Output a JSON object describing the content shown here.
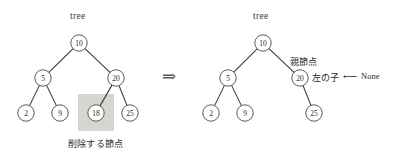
{
  "figure": {
    "title_left": "tree",
    "title_right": "tree",
    "transform_symbol": "⇒",
    "background_color": "#ffffff",
    "node_stroke_color": "#4a4a4a",
    "edge_color": "#3b3b3b",
    "highlight_color": "#d3d3ca"
  },
  "left_tree": {
    "label": "tree",
    "caption": "削除する節点",
    "nodes": [
      {
        "id": "l10",
        "value": "10",
        "cx": 79,
        "cy": 43
      },
      {
        "id": "l5",
        "value": "5",
        "cx": 43,
        "cy": 78
      },
      {
        "id": "l20",
        "value": "20",
        "cx": 116,
        "cy": 78
      },
      {
        "id": "l2",
        "value": "2",
        "cx": 26,
        "cy": 113
      },
      {
        "id": "l9",
        "value": "9",
        "cx": 60,
        "cy": 113
      },
      {
        "id": "l18",
        "value": "18",
        "cx": 96,
        "cy": 113
      },
      {
        "id": "l25",
        "value": "25",
        "cx": 130,
        "cy": 113
      }
    ],
    "edges": [
      {
        "from": "l10",
        "to": "l5"
      },
      {
        "from": "l10",
        "to": "l20"
      },
      {
        "from": "l5",
        "to": "l2"
      },
      {
        "from": "l5",
        "to": "l9"
      },
      {
        "from": "l20",
        "to": "l18"
      },
      {
        "from": "l20",
        "to": "l25"
      }
    ],
    "highlight": {
      "x": 78,
      "y": 94,
      "width": 36,
      "height": 37
    }
  },
  "right_tree": {
    "label": "tree",
    "nodes": [
      {
        "id": "r10",
        "value": "10",
        "cx": 263,
        "cy": 43
      },
      {
        "id": "r5",
        "value": "5",
        "cx": 228,
        "cy": 78
      },
      {
        "id": "r20",
        "value": "20",
        "cx": 300,
        "cy": 78
      },
      {
        "id": "r2",
        "value": "2",
        "cx": 211,
        "cy": 113
      },
      {
        "id": "r9",
        "value": "9",
        "cx": 245,
        "cy": 113
      },
      {
        "id": "r25",
        "value": "25",
        "cx": 314,
        "cy": 113
      }
    ],
    "edges": [
      {
        "from": "r10",
        "to": "r5"
      },
      {
        "from": "r10",
        "to": "r20"
      },
      {
        "from": "r5",
        "to": "r2"
      },
      {
        "from": "r5",
        "to": "r9"
      },
      {
        "from": "r20",
        "to": "r25"
      }
    ],
    "annotations": {
      "parent_node": "親節点",
      "left_child": "左の子",
      "assign_arrow": "⟵",
      "none_value": "None"
    }
  },
  "geometry": {
    "node_radius": 8.2
  }
}
